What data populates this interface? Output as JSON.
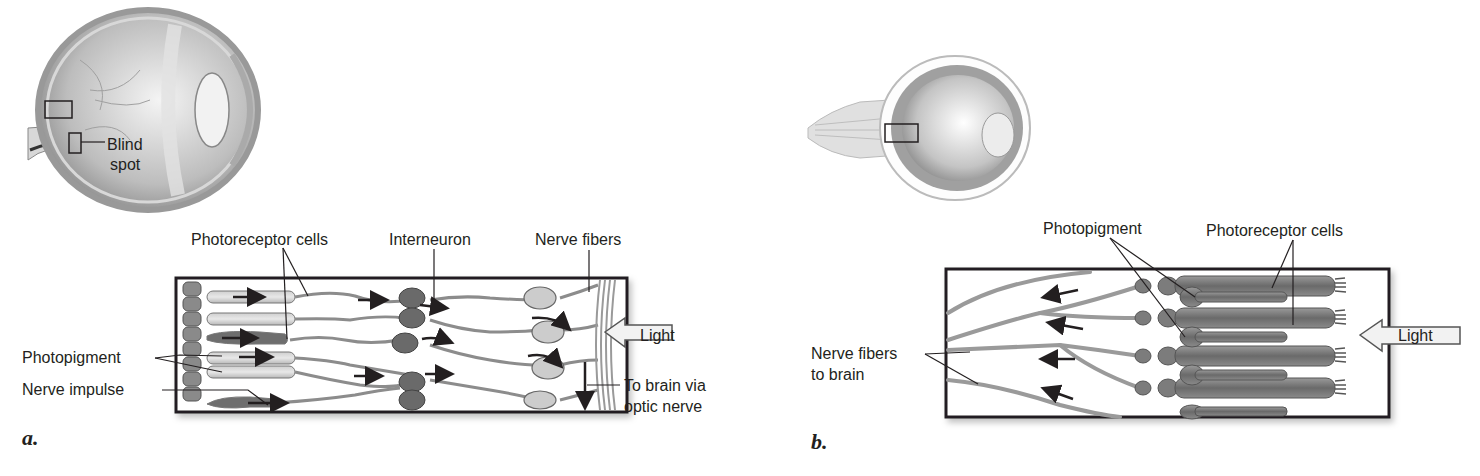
{
  "panel_a": {
    "letter": "a.",
    "eye_labels": {
      "blind_spot_line1": "Blind",
      "blind_spot_line2": "spot"
    },
    "labels": {
      "photoreceptor_cells": "Photoreceptor cells",
      "interneuron": "Interneuron",
      "nerve_fibers": "Nerve fibers",
      "photopigment": "Photopigment",
      "nerve_impulse": "Nerve impulse",
      "light": "Light",
      "to_brain_line1": "To brain via",
      "to_brain_line2": "optic nerve"
    }
  },
  "panel_b": {
    "letter": "b.",
    "labels": {
      "photopigment": "Photopigment",
      "photoreceptor_cells": "Photoreceptor cells",
      "nerve_fibers_line1": "Nerve fibers",
      "nerve_fibers_line2": "to brain",
      "light": "Light"
    }
  },
  "colors": {
    "ink": "#231f20",
    "cell_gray": "#7a7a7a",
    "dark_cell": "#555555",
    "light_fill": "#e6e6e6"
  }
}
